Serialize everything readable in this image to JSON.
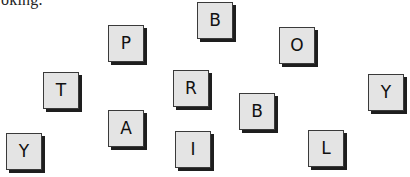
{
  "text_fragment": "oking.",
  "tiles": [
    {
      "letter": "P",
      "x": 108,
      "y": 25
    },
    {
      "letter": "B",
      "x": 197,
      "y": 2
    },
    {
      "letter": "O",
      "x": 279,
      "y": 27
    },
    {
      "letter": "T",
      "x": 43,
      "y": 72
    },
    {
      "letter": "R",
      "x": 173,
      "y": 70
    },
    {
      "letter": "Y",
      "x": 368,
      "y": 74
    },
    {
      "letter": "A",
      "x": 108,
      "y": 110
    },
    {
      "letter": "B",
      "x": 239,
      "y": 93
    },
    {
      "letter": "Y",
      "x": 6,
      "y": 133
    },
    {
      "letter": "I",
      "x": 175,
      "y": 131
    },
    {
      "letter": "L",
      "x": 308,
      "y": 130
    }
  ]
}
